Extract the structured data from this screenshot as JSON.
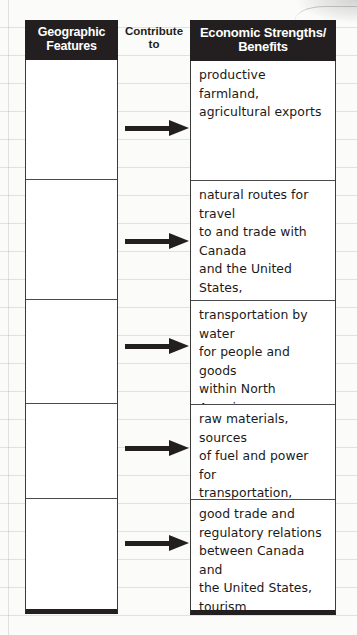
{
  "organizer": {
    "columns": {
      "left": {
        "header": "Geographic\nFeatures",
        "rows": [
          {
            "text": ""
          },
          {
            "text": ""
          },
          {
            "text": ""
          },
          {
            "text": ""
          },
          {
            "text": ""
          }
        ]
      },
      "middle": {
        "header": "Contribute\nto",
        "arrow_icon": "arrow-right-icon",
        "arrow_count": 5
      },
      "right": {
        "header": "Economic Strengths/\nBenefits",
        "rows": [
          {
            "text": "productive farmland,\nagricultural exports"
          },
          {
            "text": "natural routes for travel\nto and trade with Canada\nand the United States,\neasy-to-defend location,\nfishing industry,\nrecreation and tourism"
          },
          {
            "text": "transportation by water\nfor people and goods\nwithin North America,\nfishing industry, power\nsource, recreation"
          },
          {
            "text": "raw materials, sources\nof fuel and power for\ntransportation, industry,\nand new technologies"
          },
          {
            "text": "good trade and\nregulatory relations\nbetween Canada and\nthe United States,\ntourism"
          }
        ]
      }
    },
    "colors": {
      "header_background": "#231f20",
      "header_text": "#ffffff",
      "cell_background": "#ffffff",
      "cell_text": "#1a1a1a",
      "border": "#3a3a3a",
      "arrow": "#231f20",
      "page_background": "#fbfbfa",
      "rule_line": "#a0a6aa"
    }
  }
}
